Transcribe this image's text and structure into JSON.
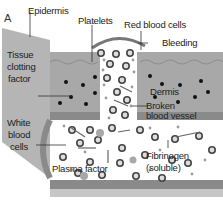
{
  "figure": {
    "panel_letter": "A"
  },
  "labels": {
    "epidermis": "Epidermis",
    "platelets": "Platelets",
    "red_blood_cells": "Red blood cells",
    "bleeding": "Bleeding",
    "tissue_clotting_factor_1": "Tissue",
    "tissue_clotting_factor_2": "clotting",
    "tissue_clotting_factor_3": "factor",
    "dermis": "Dermis",
    "broken_vessel_1": "Broken",
    "broken_vessel_2": "blood vessel",
    "white_blood_cells_1": "White",
    "white_blood_cells_2": "blood",
    "white_blood_cells_3": "cells",
    "plasma_factor": "Plasma factor",
    "fibrinogen_1": "Fibrinogen",
    "fibrinogen_2": "(soluble)"
  },
  "colors": {
    "tissue": "#a9a9a9",
    "tissue_dark": "#8f8f8f",
    "side_face": "#b8b8b8",
    "vessel_wall": "#7a7a7a",
    "vessel_wall_light": "#c4c4c4",
    "cell": "#555555",
    "dot": "#111111",
    "platelet": "#9a9a9a"
  }
}
